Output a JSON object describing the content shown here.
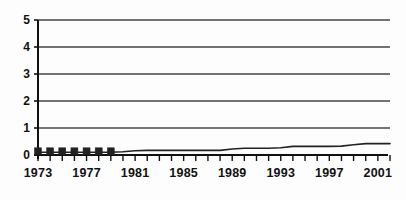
{
  "chart_data": {
    "type": "line",
    "title": "",
    "subtitle": "",
    "xlabel": "",
    "ylabel": "",
    "grid": true,
    "legend": "none",
    "xlim": [
      1973,
      2002
    ],
    "ylim": [
      0,
      5
    ],
    "y_ticks": [
      "0",
      "1",
      "2",
      "3",
      "4",
      "5"
    ],
    "y_tick_values": [
      0,
      1,
      2,
      3,
      4,
      5
    ],
    "x_tick_labels": [
      "1973",
      "1977",
      "1981",
      "1985",
      "1989",
      "1993",
      "1997",
      "2001"
    ],
    "x_tick_label_values": [
      1973,
      1977,
      1981,
      1985,
      1989,
      1993,
      1997,
      2001
    ],
    "x_minor_ticks": [
      1973,
      1974,
      1975,
      1976,
      1977,
      1978,
      1979,
      1980,
      1981,
      1982,
      1983,
      1984,
      1985,
      1986,
      1987,
      1988,
      1989,
      1990,
      1991,
      1992,
      1993,
      1994,
      1995,
      1996,
      1997,
      1998,
      1999,
      2000,
      2001,
      2002
    ],
    "x": [
      1973,
      1974,
      1975,
      1976,
      1977,
      1978,
      1979,
      1980,
      1981,
      1982,
      1983,
      1984,
      1985,
      1986,
      1987,
      1988,
      1989,
      1990,
      1991,
      1992,
      1993,
      1994,
      1995,
      1996,
      1997,
      1998,
      1999,
      2000,
      2001,
      2002
    ],
    "values": [
      0.1,
      0.1,
      0.1,
      0.1,
      0.1,
      0.1,
      0.1,
      0.12,
      0.16,
      0.17,
      0.17,
      0.17,
      0.17,
      0.17,
      0.17,
      0.17,
      0.22,
      0.25,
      0.25,
      0.25,
      0.27,
      0.32,
      0.32,
      0.32,
      0.32,
      0.33,
      0.38,
      0.42,
      0.42,
      0.42
    ],
    "marker_years": [
      1973,
      1974,
      1975,
      1976,
      1977,
      1978,
      1979
    ],
    "marker_values": [
      0.1,
      0.1,
      0.1,
      0.1,
      0.1,
      0.1,
      0.1
    ],
    "marker_shape": "filled-square",
    "series_color": "#222222",
    "grid_color": "#444444",
    "axis_color": "#111111",
    "background_color": "#fdfdfd"
  }
}
